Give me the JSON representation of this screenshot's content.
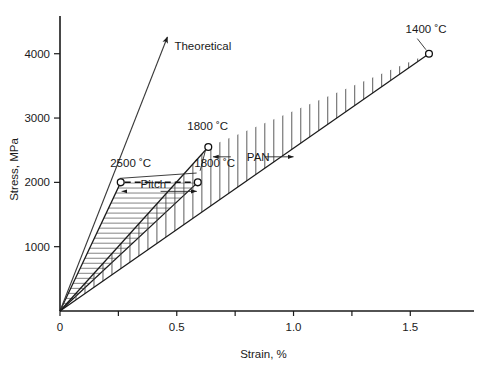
{
  "chart_data": {
    "type": "line",
    "title": "",
    "xlabel": "Strain, %",
    "ylabel": "Stress, MPa",
    "xlim": [
      0,
      1.7
    ],
    "ylim": [
      0,
      4400
    ],
    "grid": false,
    "legend_position": "none",
    "x_ticks": [
      0,
      0.25,
      0.5,
      0.75,
      1.0,
      1.25,
      1.5
    ],
    "x_tick_labels": [
      "0",
      "",
      "0.5",
      "",
      "1.0",
      "",
      "1.5"
    ],
    "y_ticks": [
      0,
      1000,
      2000,
      3000,
      4000
    ],
    "y_tick_labels": [
      "0",
      "1000",
      "2000",
      "3000",
      "4000"
    ],
    "series": [
      {
        "name": "Theoretical",
        "label": "Theoretical",
        "style": "arrow",
        "x": [
          0,
          0.46
        ],
        "values": [
          0,
          4260
        ]
      },
      {
        "name": "Pitch upper bound (2500 C)",
        "label": "2500 ˚C",
        "style": "solid",
        "x": [
          0,
          0.26
        ],
        "values": [
          0,
          2000
        ],
        "endpoint_marker": true
      },
      {
        "name": "Pitch lower bound (1800 C)",
        "label": "1800 ˚C",
        "style": "solid",
        "x": [
          0,
          0.59
        ],
        "values": [
          0,
          2000
        ],
        "endpoint_marker": true
      },
      {
        "name": "PAN upper bound (1800 C)",
        "label": "1800 ˚C",
        "style": "solid",
        "x": [
          0,
          0.635
        ],
        "values": [
          0,
          2550
        ],
        "endpoint_marker": true
      },
      {
        "name": "PAN lower bound (1400 C)",
        "label": "1400 ˚C",
        "style": "solid",
        "x": [
          0,
          1.58
        ],
        "values": [
          0,
          4000
        ],
        "endpoint_marker": true
      }
    ],
    "regions": [
      {
        "name": "Pitch",
        "label": "Pitch",
        "hatch": "horizontal",
        "upper_series": "Pitch upper bound (2500 C)",
        "lower_series": "Pitch lower bound (1800 C)"
      },
      {
        "name": "PAN",
        "label": "PAN",
        "hatch": "vertical",
        "upper_series": "PAN upper bound (1800 C)",
        "lower_series": "PAN lower bound (1400 C)"
      }
    ],
    "annotations": [
      {
        "name": "theoretical-label",
        "text": "Theoretical",
        "x": 0.49,
        "y": 4060
      },
      {
        "name": "label-2500c",
        "text": "2500 ˚C",
        "x": 0.215,
        "y": 2240
      },
      {
        "name": "label-1800c-pitch",
        "text": "1800 ˚C",
        "x": 0.575,
        "y": 2240
      },
      {
        "name": "label-1800c-pan",
        "text": "1800 ˚C",
        "x": 0.545,
        "y": 2820
      },
      {
        "name": "label-1400c",
        "text": "1400 ˚C",
        "x": 1.48,
        "y": 4330
      },
      {
        "name": "region-label-pitch",
        "text": "Pitch",
        "x": 0.345,
        "y": 1905
      },
      {
        "name": "region-label-pan",
        "text": "PAN",
        "x": 0.8,
        "y": 2335
      }
    ],
    "axis_labels": {
      "x_title": "Strain, %",
      "y_title": "Stress, MPa"
    }
  }
}
